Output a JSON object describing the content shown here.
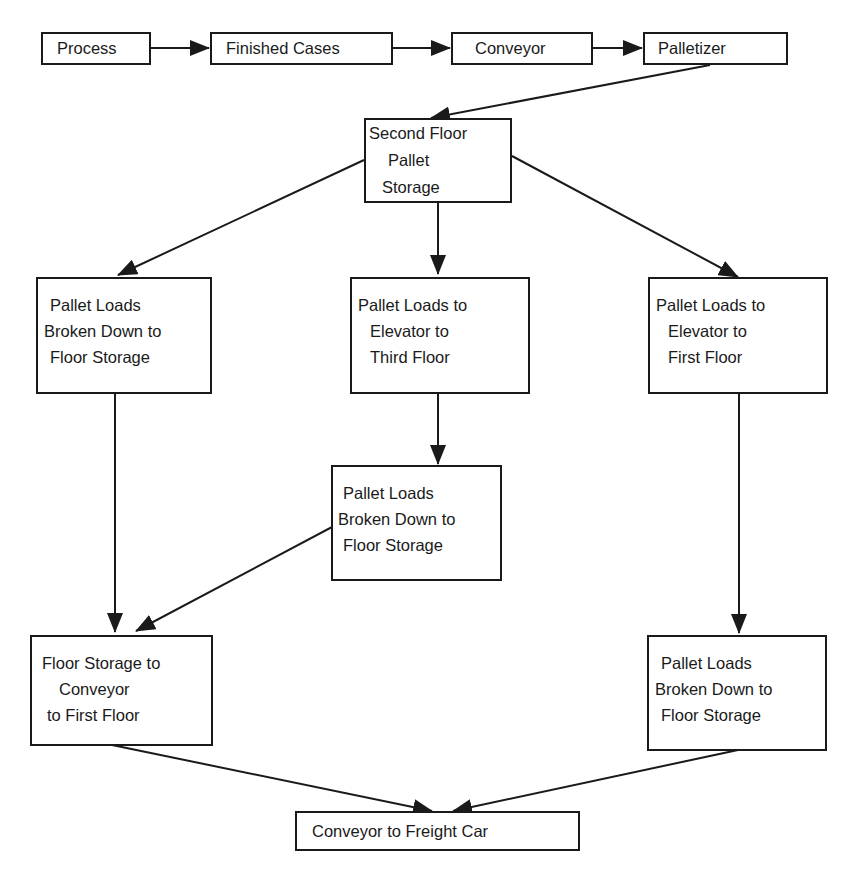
{
  "diagram": {
    "type": "flowchart",
    "nodes": [
      {
        "id": "process",
        "lines": [
          "Process"
        ]
      },
      {
        "id": "finished_cases",
        "lines": [
          "Finished Cases"
        ]
      },
      {
        "id": "conveyor",
        "lines": [
          "Conveyor"
        ]
      },
      {
        "id": "palletizer",
        "lines": [
          "Palletizer"
        ]
      },
      {
        "id": "second_floor_storage",
        "lines": [
          "Second Floor",
          "Pallet",
          "Storage"
        ]
      },
      {
        "id": "broken_down_left",
        "lines": [
          "Pallet Loads",
          "Broken Down to",
          "Floor Storage"
        ]
      },
      {
        "id": "elevator_third",
        "lines": [
          "Pallet Loads to",
          "Elevator to",
          "Third Floor"
        ]
      },
      {
        "id": "elevator_first",
        "lines": [
          "Pallet Loads to",
          "Elevator to",
          "First Floor"
        ]
      },
      {
        "id": "broken_down_middle",
        "lines": [
          "Pallet Loads",
          "Broken Down to",
          "Floor Storage"
        ]
      },
      {
        "id": "floor_storage_conveyor",
        "lines": [
          "Floor Storage to",
          "Conveyor",
          "to First Floor"
        ]
      },
      {
        "id": "broken_down_right",
        "lines": [
          "Pallet Loads",
          "Broken Down to",
          "Floor Storage"
        ]
      },
      {
        "id": "conveyor_freight",
        "lines": [
          "Conveyor to Freight Car"
        ]
      }
    ],
    "edges": [
      {
        "from": "process",
        "to": "finished_cases"
      },
      {
        "from": "finished_cases",
        "to": "conveyor"
      },
      {
        "from": "conveyor",
        "to": "palletizer"
      },
      {
        "from": "palletizer",
        "to": "second_floor_storage"
      },
      {
        "from": "second_floor_storage",
        "to": "broken_down_left"
      },
      {
        "from": "second_floor_storage",
        "to": "elevator_third"
      },
      {
        "from": "second_floor_storage",
        "to": "elevator_first"
      },
      {
        "from": "elevator_third",
        "to": "broken_down_middle"
      },
      {
        "from": "broken_down_left",
        "to": "floor_storage_conveyor"
      },
      {
        "from": "broken_down_middle",
        "to": "floor_storage_conveyor"
      },
      {
        "from": "elevator_first",
        "to": "broken_down_right"
      },
      {
        "from": "floor_storage_conveyor",
        "to": "conveyor_freight"
      },
      {
        "from": "broken_down_right",
        "to": "conveyor_freight"
      }
    ]
  }
}
